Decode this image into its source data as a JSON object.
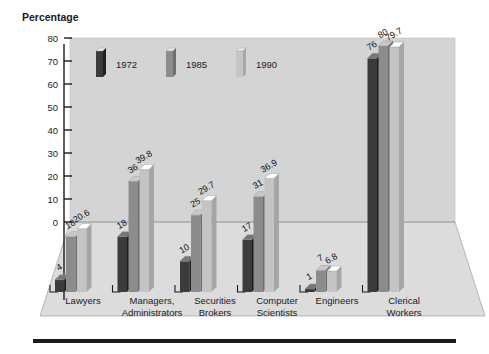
{
  "chart_data": {
    "type": "bar",
    "title": "",
    "ylabel": "Percentage",
    "xlabel": "",
    "ylim": [
      0,
      80
    ],
    "yticks": [
      0,
      10,
      20,
      30,
      40,
      50,
      60,
      70,
      80
    ],
    "grid": false,
    "legend_position": "top-left-inside",
    "projection": "3d",
    "categories": [
      "Lawyers",
      "Managers, Administrators",
      "Securities Brokers",
      "Computer Scientists",
      "Engineers",
      "Clerical Workers"
    ],
    "category_lines": [
      [
        "Lawyers",
        ""
      ],
      [
        "Managers,",
        "Administrators"
      ],
      [
        "Securities",
        "Brokers"
      ],
      [
        "Computer",
        "Scientists"
      ],
      [
        "Engineers",
        ""
      ],
      [
        "Clerical",
        "Workers"
      ]
    ],
    "series": [
      {
        "name": "1972",
        "color": "#3b3b3b",
        "values": [
          4,
          18,
          10,
          17,
          1,
          76
        ],
        "labels": [
          "4",
          "18",
          "10",
          "17",
          "1",
          "76"
        ]
      },
      {
        "name": "1985",
        "color": "#8c8c8c",
        "values": [
          18,
          36,
          25,
          31,
          7,
          80
        ],
        "labels": [
          "18",
          "36",
          "25",
          "31",
          "7",
          "80"
        ]
      },
      {
        "name": "1990",
        "color": "#c4c4c4",
        "values": [
          20.6,
          39.8,
          29.7,
          36.9,
          6.8,
          79.7
        ],
        "labels": [
          "20.6",
          "39.8",
          "29.7",
          "36.9",
          "6.8",
          "79.7"
        ]
      }
    ]
  },
  "legend": {
    "entries": [
      {
        "label": "1972",
        "color": "#3b3b3b"
      },
      {
        "label": "1985",
        "color": "#8c8c8c"
      },
      {
        "label": "1990",
        "color": "#c4c4c4"
      }
    ]
  },
  "axis": {
    "y_title": "Percentage",
    "y_ticks": [
      "80",
      "70",
      "60",
      "50",
      "40",
      "30",
      "20",
      "10",
      "0"
    ]
  },
  "colors": {
    "plot_background": "#d4d4d4",
    "floor": "#dcdcdc",
    "floor_edge": "#9a9a9a",
    "axis": "#1b1b1b",
    "bottom_rule": "#1b1b1b",
    "series_1972": "#3b3b3b",
    "series_1985": "#8c8c8c",
    "series_1990": "#c4c4c4"
  }
}
